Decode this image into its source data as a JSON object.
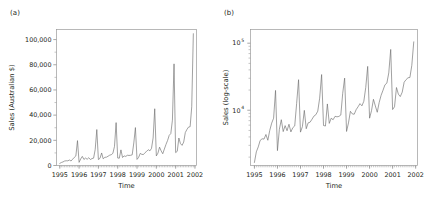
{
  "figure": {
    "width": 429,
    "height": 203,
    "background": "#ffffff",
    "line_color": "#6d6d6d",
    "frame_color": "#9a9a9a",
    "text_color": "#231f20"
  },
  "panels": [
    {
      "id": "a",
      "label": "(a)",
      "ylabel": "Sales (Australian $)",
      "xlabel": "Time",
      "yticklabels": [
        "0",
        "20,000",
        "40,000",
        "60,000",
        "80,000",
        "100,000"
      ],
      "ytickvalues": [
        0,
        20000,
        40000,
        60000,
        80000,
        100000
      ],
      "xticklabels": [
        "1995",
        "1996",
        "1997",
        "1998",
        "1999",
        "2000",
        "2001",
        "2002"
      ],
      "xtickvalues": [
        1995,
        1996,
        1997,
        1998,
        1999,
        2000,
        2001,
        2002
      ],
      "yscale": "linear",
      "ylim": [
        0,
        108000
      ],
      "xlim": [
        1994.83,
        2002.08
      ],
      "grid": false,
      "legend": "none"
    },
    {
      "id": "b",
      "label": "(b)",
      "ylabel": "Sales (log-scale)",
      "xlabel": "Time",
      "yticklabels": [
        "10⁴",
        "10⁵"
      ],
      "ytickvalues": [
        10000,
        100000
      ],
      "ytickbase": [
        "10",
        "10"
      ],
      "ytickexp": [
        "4",
        "5"
      ],
      "xticklabels": [
        "1995",
        "1996",
        "1997",
        "1998",
        "1999",
        "2000",
        "2001",
        "2002"
      ],
      "xtickvalues": [
        1995,
        1996,
        1997,
        1998,
        1999,
        2000,
        2001,
        2002
      ],
      "yscale": "log",
      "ylim": [
        1500,
        160000
      ],
      "xlim": [
        1994.83,
        2002.08
      ],
      "grid": false,
      "legend": "none"
    }
  ],
  "chart_data": {
    "type": "line",
    "title": "",
    "subtitle": "",
    "xlabel": "Time",
    "ylabel": "Sales (Australian $)",
    "series_name": "Monthly sales of Australian souvenir shop",
    "x_start": "1995-01",
    "x_end": "2001-12",
    "frequency": "monthly",
    "x": [
      1995.0,
      1995.083,
      1995.167,
      1995.25,
      1995.333,
      1995.417,
      1995.5,
      1995.583,
      1995.667,
      1995.75,
      1995.833,
      1995.917,
      1996.0,
      1996.083,
      1996.167,
      1996.25,
      1996.333,
      1996.417,
      1996.5,
      1996.583,
      1996.667,
      1996.75,
      1996.833,
      1996.917,
      1997.0,
      1997.083,
      1997.167,
      1997.25,
      1997.333,
      1997.417,
      1997.5,
      1997.583,
      1997.667,
      1997.75,
      1997.833,
      1997.917,
      1998.0,
      1998.083,
      1998.167,
      1998.25,
      1998.333,
      1998.417,
      1998.5,
      1998.583,
      1998.667,
      1998.75,
      1998.833,
      1998.917,
      1999.0,
      1999.083,
      1999.167,
      1999.25,
      1999.333,
      1999.417,
      1999.5,
      1999.583,
      1999.667,
      1999.75,
      1999.833,
      1999.917,
      2000.0,
      2000.083,
      2000.167,
      2000.25,
      2000.333,
      2000.417,
      2000.5,
      2000.583,
      2000.667,
      2000.75,
      2000.833,
      2000.917,
      2001.0,
      2001.083,
      2001.167,
      2001.25,
      2001.333,
      2001.417,
      2001.5,
      2001.583,
      2001.667,
      2001.75,
      2001.833,
      2001.917
    ],
    "values": [
      1664.81,
      2397.53,
      2840.71,
      3547.29,
      3752.96,
      3714.74,
      4349.61,
      3566.34,
      5021.82,
      6423.48,
      7600.6,
      19756.21,
      2499.81,
      5198.24,
      7225.14,
      4806.03,
      5900.88,
      4951.34,
      6179.12,
      4752.15,
      5496.43,
      5835.1,
      12600.08,
      28541.72,
      4717.02,
      5702.63,
      9957.58,
      5304.78,
      6492.43,
      6630.8,
      7349.62,
      8176.62,
      8573.17,
      9690.5,
      15151.84,
      34061.01,
      5921.1,
      5814.58,
      12421.25,
      6369.77,
      7609.12,
      7224.75,
      8121.22,
      7979.25,
      8093.06,
      8476.7,
      17914.66,
      30114.41,
      4826.64,
      6470.23,
      9638.77,
      8821.17,
      8722.37,
      10209.48,
      11276.55,
      12552.22,
      11637.39,
      13606.89,
      21822.11,
      45060.69,
      7615.03,
      9849.69,
      14558.4,
      11587.33,
      9332.56,
      13082.09,
      16732.78,
      19888.61,
      23933.38,
      25391.35,
      36024.8,
      80721.71,
      10243.24,
      11266.88,
      21826.84,
      17357.33,
      15997.79,
      18601.53,
      26155.15,
      28586.52,
      30505.41,
      30821.33,
      46634.38,
      104660.67
    ],
    "peaks": [
      {
        "x": 1995.917,
        "y": 19756,
        "label": "Dec 1995"
      },
      {
        "x": 1996.917,
        "y": 28542,
        "label": "Dec 1996"
      },
      {
        "x": 1997.917,
        "y": 34061,
        "label": "Dec 1997"
      },
      {
        "x": 1998.917,
        "y": 30114,
        "label": "Dec 1998"
      },
      {
        "x": 1999.917,
        "y": 45061,
        "label": "Dec 1999"
      },
      {
        "x": 2000.917,
        "y": 80722,
        "label": "Dec 2000"
      },
      {
        "x": 2001.917,
        "y": 104661,
        "label": "Dec 2001"
      }
    ]
  }
}
